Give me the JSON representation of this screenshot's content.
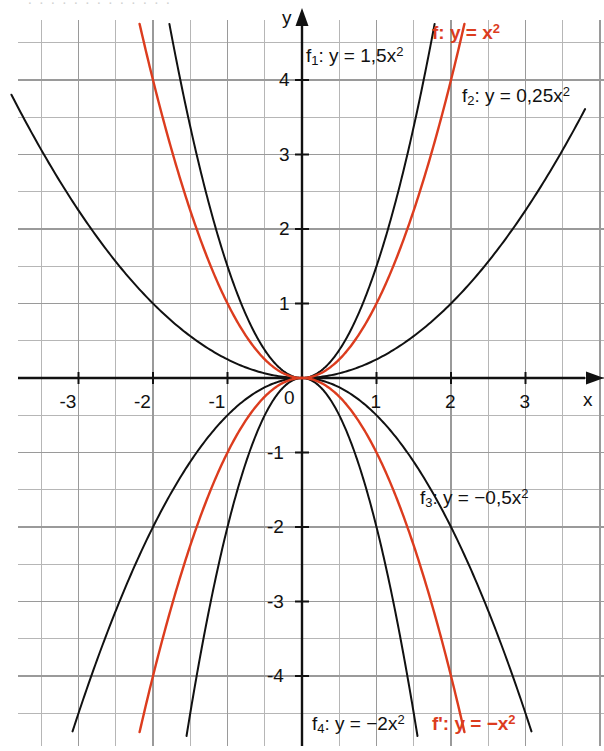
{
  "figure": {
    "background": "#ffffff",
    "grid_color": "#9a9a9a",
    "minor_grid_color": "#b6b6b6",
    "axis_color": "#111111",
    "curve_color": "#111111",
    "highlight_color": "#dc3c1e"
  },
  "axes": {
    "x_axis_label": "x",
    "y_axis_label": "y",
    "x_ticks": [
      "-3",
      "-2",
      "-1",
      "1",
      "2",
      "3"
    ],
    "y_ticks": [
      "4",
      "3",
      "2",
      "1",
      "-1",
      "-2",
      "-3",
      "-4"
    ],
    "origin_label": "0",
    "x_range": [
      -3.85,
      4.05
    ],
    "y_range": [
      -5.0,
      4.8
    ],
    "minor_step": 0.5,
    "major_step": 1
  },
  "labels": {
    "f1": {
      "text": "f",
      "sub": "1",
      "rest": ": y = 1,5x",
      "sup": "2",
      "color": "#111111"
    },
    "f2": {
      "text": "f",
      "sub": "2",
      "rest": ": y = 0,25x",
      "sup": "2",
      "color": "#111111"
    },
    "f3": {
      "text": "f",
      "sub": "3",
      "rest": ": y = −0,5x",
      "sup": "2",
      "color": "#111111"
    },
    "f4": {
      "text": "f",
      "sub": "4",
      "rest": ": y = −2x",
      "sup": "2",
      "color": "#111111"
    },
    "f": {
      "text": "f",
      "sub": "",
      "rest": ": y = x",
      "sup": "2",
      "color": "#dc3c1e"
    },
    "fprime": {
      "text": "f'",
      "sub": "",
      "rest": ": y = −x",
      "sup": "2",
      "color": "#dc3c1e"
    }
  },
  "chart_data": {
    "type": "line",
    "title": "",
    "subtitle": "",
    "xlabel": "x",
    "ylabel": "y",
    "xlim": [
      -3.85,
      4.05
    ],
    "ylim": [
      -5.0,
      4.8
    ],
    "grid": true,
    "legend": "inline-annotations",
    "x": [
      -3.9,
      -3.6,
      -3.3,
      -3.0,
      -2.7,
      -2.4,
      -2.1,
      -1.8,
      -1.5,
      -1.2,
      -0.9,
      -0.6,
      -0.3,
      0.0,
      0.3,
      0.6,
      0.9,
      1.2,
      1.5,
      1.8,
      2.1,
      2.4,
      2.7,
      3.0,
      3.3,
      3.6,
      3.9
    ],
    "series": [
      {
        "name": "f: y = x²",
        "equation": "y = x^2",
        "coefficient": 1,
        "color": "#dc3c1e",
        "values": [
          15.21,
          12.96,
          10.89,
          9.0,
          7.29,
          5.76,
          4.41,
          3.24,
          2.25,
          1.44,
          0.81,
          0.36,
          0.09,
          0.0,
          0.09,
          0.36,
          0.81,
          1.44,
          2.25,
          3.24,
          4.41,
          5.76,
          7.29,
          9.0,
          10.89,
          12.96,
          15.21
        ],
        "drawn_x_range": [
          -2.18,
          2.18
        ]
      },
      {
        "name": "f₁: y = 1,5x²",
        "equation": "y = 1.5x^2",
        "coefficient": 1.5,
        "color": "#111111",
        "values": [
          22.82,
          19.44,
          16.34,
          13.5,
          10.94,
          8.64,
          6.62,
          4.86,
          3.38,
          2.16,
          1.22,
          0.54,
          0.14,
          0.0,
          0.14,
          0.54,
          1.22,
          2.16,
          3.38,
          4.86,
          6.62,
          8.64,
          10.94,
          13.5,
          16.34,
          19.44,
          22.82
        ],
        "drawn_x_range": [
          -1.78,
          1.78
        ]
      },
      {
        "name": "f₂: y = 0,25x²",
        "equation": "y = 0.25x^2",
        "coefficient": 0.25,
        "color": "#111111",
        "values": [
          3.8,
          3.24,
          2.72,
          2.25,
          1.82,
          1.44,
          1.1,
          0.81,
          0.56,
          0.36,
          0.2,
          0.09,
          0.02,
          0.0,
          0.02,
          0.09,
          0.2,
          0.36,
          0.56,
          0.81,
          1.1,
          1.44,
          1.82,
          2.25,
          2.72,
          3.24,
          3.8
        ],
        "drawn_x_range": [
          -3.9,
          3.8
        ]
      },
      {
        "name": "f₃: y = −0,5x²",
        "equation": "y = -0.5x^2",
        "coefficient": -0.5,
        "color": "#111111",
        "values": [
          -7.61,
          -6.48,
          -5.45,
          -4.5,
          -3.65,
          -2.88,
          -2.21,
          -1.62,
          -1.13,
          -0.72,
          -0.41,
          -0.18,
          -0.05,
          0.0,
          -0.05,
          -0.18,
          -0.41,
          -0.72,
          -1.13,
          -1.62,
          -2.21,
          -2.88,
          -3.65,
          -4.5,
          -5.45,
          -6.48,
          -7.61
        ],
        "drawn_x_range": [
          -3.08,
          3.08
        ]
      },
      {
        "name": "f₄: y = −2x²",
        "equation": "y = -2x^2",
        "coefficient": -2,
        "color": "#111111",
        "values": [
          -30.42,
          -25.92,
          -21.78,
          -18.0,
          -14.58,
          -11.52,
          -8.82,
          -6.48,
          -4.5,
          -2.88,
          -1.62,
          -0.72,
          -0.18,
          0.0,
          -0.18,
          -0.72,
          -1.62,
          -2.88,
          -4.5,
          -6.48,
          -8.82,
          -11.52,
          -14.58,
          -18.0,
          -21.78,
          -25.92,
          -30.42
        ],
        "drawn_x_range": [
          -1.55,
          1.55
        ]
      },
      {
        "name": "f': y = −x²",
        "equation": "y = -x^2",
        "coefficient": -1,
        "color": "#dc3c1e",
        "values": [
          -15.21,
          -12.96,
          -10.89,
          -9.0,
          -7.29,
          -5.76,
          -4.41,
          -3.24,
          -2.25,
          -1.44,
          -0.81,
          -0.36,
          -0.09,
          0.0,
          -0.09,
          -0.36,
          -0.81,
          -1.44,
          -2.25,
          -3.24,
          -4.41,
          -5.76,
          -7.29,
          -9.0,
          -10.89,
          -12.96,
          -15.21
        ],
        "drawn_x_range": [
          -2.18,
          2.18
        ]
      }
    ],
    "annotations": [
      {
        "text": "f₁: y = 1,5x²",
        "x": -0.05,
        "y": 4.45,
        "color": "#111111"
      },
      {
        "text": "f: y = x²",
        "x": 1.6,
        "y": 4.82,
        "color": "#dc3c1e"
      },
      {
        "text": "f₂: y = 0,25x²",
        "x": 2.15,
        "y": 3.9,
        "color": "#111111"
      },
      {
        "text": "f₃: y = −0,5x²",
        "x": 1.55,
        "y": -1.57,
        "color": "#111111"
      },
      {
        "text": "f₄: y = −2x²",
        "x": 0.12,
        "y": -4.55,
        "color": "#111111"
      },
      {
        "text": "f': y = −x²",
        "x": 1.63,
        "y": -4.62,
        "color": "#dc3c1e"
      }
    ]
  }
}
